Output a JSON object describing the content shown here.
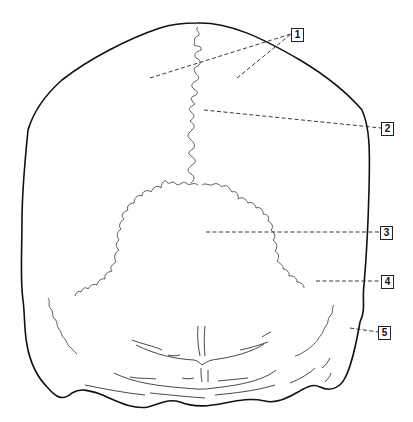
{
  "diagram": {
    "type": "anatomical line drawing",
    "colors": {
      "outline": "#111111",
      "suture": "#333333",
      "leader": "#222222",
      "background": "#ffffff"
    },
    "labels": [
      {
        "id": "1",
        "text": "1",
        "box": [
          291,
          28
        ],
        "leaders": [
          [
            [
              150,
              78
            ],
            [
              291,
              34
            ]
          ],
          [
            [
              237,
              78
            ],
            [
              291,
              34
            ]
          ]
        ]
      },
      {
        "id": "2",
        "text": "2",
        "box": [
          381,
          122
        ],
        "leaders": [
          [
            [
              204,
              110
            ],
            [
              381,
              128
            ]
          ]
        ]
      },
      {
        "id": "3",
        "text": "3",
        "box": [
          380,
          226
        ],
        "leaders": [
          [
            [
              206,
              232
            ],
            [
              380,
              232
            ]
          ]
        ]
      },
      {
        "id": "4",
        "text": "4",
        "box": [
          381,
          275
        ],
        "leaders": [
          [
            [
              316,
              281
            ],
            [
              381,
              281
            ]
          ]
        ]
      },
      {
        "id": "5",
        "text": "5",
        "box": [
          378,
          326
        ],
        "leaders": [
          [
            [
              350,
              328
            ],
            [
              378,
              332
            ]
          ]
        ]
      }
    ]
  }
}
